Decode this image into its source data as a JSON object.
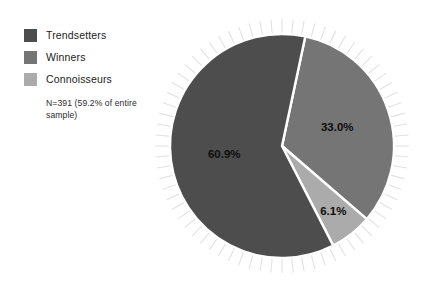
{
  "chart_data": {
    "type": "pie",
    "title": "",
    "subtitle": "",
    "legend_position": "left",
    "grid": false,
    "note": "N=391 (59.2% of entire sample)",
    "categories": [
      "Trendsetters",
      "Winners",
      "Connoisseurs"
    ],
    "values": [
      60.9,
      33.0,
      6.1
    ],
    "value_unit": "%",
    "data_labels": [
      "60.9%",
      "33.0%",
      "6.1%"
    ],
    "colors": [
      "#4d4d4d",
      "#757575",
      "#ababab"
    ],
    "slice_separator_color": "#ffffff",
    "ray_color": "#e2e2e2",
    "total_n": 391,
    "share_of_entire_sample": "59.2%",
    "slices": [
      {
        "label": "Trendsetters",
        "value": 60.9,
        "data_label": "60.9%",
        "color": "#4d4d4d"
      },
      {
        "label": "Winners",
        "value": 33.0,
        "data_label": "33.0%",
        "color": "#757575"
      },
      {
        "label": "Connoisseurs",
        "value": 6.1,
        "data_label": "6.1%",
        "color": "#ababab"
      }
    ]
  },
  "legend": {
    "items": [
      {
        "label": "Trendsetters",
        "color": "#4d4d4d"
      },
      {
        "label": "Winners",
        "color": "#757575"
      },
      {
        "label": "Connoisseurs",
        "color": "#ababab"
      }
    ],
    "note": "N=391 (59.2% of entire sample)"
  },
  "labels": {
    "trendsetters_pct": "60.9%",
    "winners_pct": "33.0%",
    "connoisseurs_pct": "6.1%"
  }
}
